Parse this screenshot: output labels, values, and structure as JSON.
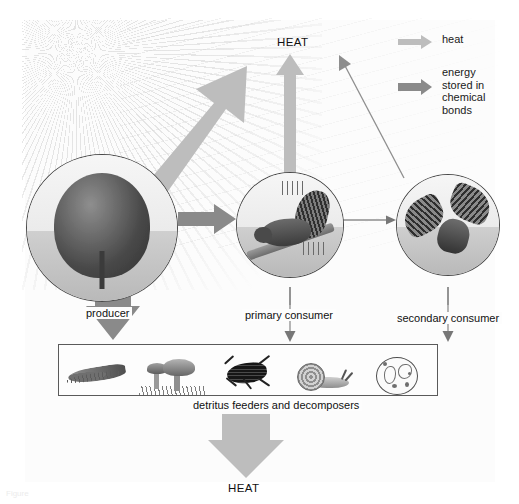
{
  "figure": {
    "type": "energy-flow-diagram",
    "title_caption": "Figure"
  },
  "legend": {
    "items": [
      {
        "label": "heat",
        "icon": "right-arrow-icon",
        "color": "#bdbdbd"
      },
      {
        "label": "energy\nstored in\nchemical\nbonds",
        "label_lines": [
          "energy",
          "stored in",
          "chemical",
          "bonds"
        ],
        "icon": "right-arrow-icon",
        "color": "#8a8a8a"
      }
    ]
  },
  "labels": {
    "heat_top": "HEAT",
    "heat_bottom": "HEAT",
    "producer": "producer",
    "primary_consumer": "primary consumer",
    "secondary_consumer": "secondary consumer",
    "detritus": "detritus feeders and decomposers"
  },
  "nodes": [
    {
      "id": "producer",
      "label": "producer",
      "illustration": "tree-icon"
    },
    {
      "id": "primary-consumer",
      "label": "primary consumer",
      "illustration": "squirrel-icon"
    },
    {
      "id": "secondary-consumer",
      "label": "secondary consumer",
      "illustration": "eagle-icon"
    }
  ],
  "detritus_organisms": [
    {
      "id": "earthworm",
      "icon": "earthworm-icon"
    },
    {
      "id": "mushrooms",
      "icon": "mushroom-icon"
    },
    {
      "id": "beetle",
      "icon": "beetle-icon"
    },
    {
      "id": "snail",
      "icon": "snail-icon"
    },
    {
      "id": "microbes",
      "icon": "microbe-dish-icon"
    }
  ],
  "flows": [
    {
      "from": "sunlight",
      "to": "atmosphere",
      "kind": "heat"
    },
    {
      "from": "producer",
      "to": "primary-consumer",
      "kind": "energy"
    },
    {
      "from": "primary-consumer",
      "to": "secondary-consumer",
      "kind": "energy"
    },
    {
      "from": "primary-consumer",
      "to": "heat_top",
      "kind": "heat"
    },
    {
      "from": "producer",
      "to": "detritus",
      "kind": "energy"
    },
    {
      "from": "primary-consumer",
      "to": "detritus",
      "kind": "energy"
    },
    {
      "from": "secondary-consumer",
      "to": "detritus",
      "kind": "energy"
    },
    {
      "from": "detritus",
      "to": "heat_bottom",
      "kind": "heat"
    }
  ],
  "colors": {
    "heat_arrow": "#bdbdbd",
    "energy_arrow": "#8a8a8a",
    "outline": "#4a4a4a",
    "text": "#111111",
    "background": "#ffffff"
  }
}
